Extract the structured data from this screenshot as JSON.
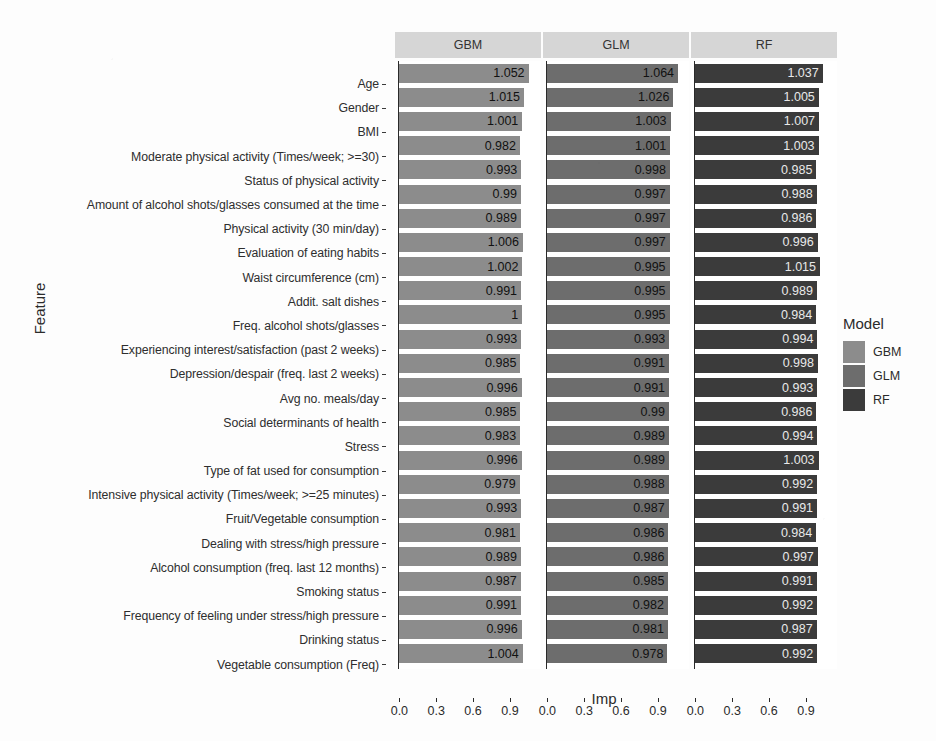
{
  "chart_data": {
    "type": "bar",
    "title": "",
    "xlabel": "Imp",
    "ylabel": "Feature",
    "orientation": "horizontal",
    "facet_by": "Model",
    "xlim": [
      0,
      1.064
    ],
    "xticks": [
      0.0,
      0.3,
      0.6,
      0.9
    ],
    "xticklabels": [
      "0.0",
      "0.3",
      "0.6",
      "0.9"
    ],
    "grid": false,
    "legend": {
      "title": "Model",
      "position": "right",
      "entries": [
        {
          "label": "GBM",
          "color": "#8c8c8c"
        },
        {
          "label": "GLM",
          "color": "#6d6d6d"
        },
        {
          "label": "RF",
          "color": "#3b3b3b"
        }
      ]
    },
    "panels": [
      {
        "label": "GBM",
        "color": "#8c8c8c"
      },
      {
        "label": "GLM",
        "color": "#6d6d6d"
      },
      {
        "label": "RF",
        "color": "#3b3b3b"
      }
    ],
    "categories": [
      "Age",
      "Gender",
      "BMI",
      "Moderate physical activity (Times/week;  >=30)",
      "Status of physical activity",
      "Amount of alcohol shots/glasses consumed at the time",
      "Physical activity (30 min/day)",
      "Evaluation of eating habits",
      "Waist circumference (cm)",
      "Addit. salt dishes",
      "Freq. alcohol shots/glasses",
      "Experiencing interest/satisfaction (past 2 weeks)",
      "Depression/despair (freq. last 2 weeks)",
      "Avg no. meals/day",
      "Social determinants of health",
      "Stress",
      "Type of fat used for consumption",
      "Intensive physical activity (Times/week; >=25 minutes)",
      "Fruit/Vegetable consumption",
      "Dealing with stress/high pressure",
      "Alcohol consumption (freq. last 12 months)",
      "Smoking status",
      "Frequency of feeling under stress/high pressure",
      "Drinking status",
      "Vegetable consumption (Freq)"
    ],
    "series": [
      {
        "name": "GBM",
        "color": "#8c8c8c",
        "values": [
          1.052,
          1.015,
          1.001,
          0.982,
          0.993,
          0.99,
          0.989,
          1.006,
          1.002,
          0.991,
          1,
          0.993,
          0.985,
          0.996,
          0.985,
          0.983,
          0.996,
          0.979,
          0.993,
          0.981,
          0.989,
          0.987,
          0.991,
          0.996,
          1.004
        ],
        "labels": [
          "1.052",
          "1.015",
          "1.001",
          "0.982",
          "0.993",
          "0.99",
          "0.989",
          "1.006",
          "1.002",
          "0.991",
          "1",
          "0.993",
          "0.985",
          "0.996",
          "0.985",
          "0.983",
          "0.996",
          "0.979",
          "0.993",
          "0.981",
          "0.989",
          "0.987",
          "0.991",
          "0.996",
          "1.004"
        ]
      },
      {
        "name": "GLM",
        "color": "#6d6d6d",
        "values": [
          1.064,
          1.026,
          1.003,
          1.001,
          0.998,
          0.997,
          0.997,
          0.997,
          0.995,
          0.995,
          0.995,
          0.993,
          0.991,
          0.991,
          0.99,
          0.989,
          0.989,
          0.988,
          0.987,
          0.986,
          0.986,
          0.985,
          0.982,
          0.981,
          0.978
        ],
        "labels": [
          "1.064",
          "1.026",
          "1.003",
          "1.001",
          "0.998",
          "0.997",
          "0.997",
          "0.997",
          "0.995",
          "0.995",
          "0.995",
          "0.993",
          "0.991",
          "0.991",
          "0.99",
          "0.989",
          "0.989",
          "0.988",
          "0.987",
          "0.986",
          "0.986",
          "0.985",
          "0.982",
          "0.981",
          "0.978"
        ]
      },
      {
        "name": "RF",
        "color": "#3b3b3b",
        "values": [
          1.037,
          1.005,
          1.007,
          1.003,
          0.985,
          0.988,
          0.986,
          0.996,
          1.015,
          0.989,
          0.984,
          0.994,
          0.998,
          0.993,
          0.986,
          0.994,
          1.003,
          0.992,
          0.991,
          0.984,
          0.997,
          0.991,
          0.992,
          0.987,
          0.992
        ],
        "labels": [
          "1.037",
          "1.005",
          "1.007",
          "1.003",
          "0.985",
          "0.988",
          "0.986",
          "0.996",
          "1.015",
          "0.989",
          "0.984",
          "0.994",
          "0.998",
          "0.993",
          "0.986",
          "0.994",
          "1.003",
          "0.992",
          "0.991",
          "0.984",
          "0.997",
          "0.991",
          "0.992",
          "0.987",
          "0.992"
        ]
      }
    ]
  }
}
